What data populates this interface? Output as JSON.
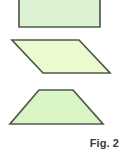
{
  "figure": {
    "caption": "Fig. 2",
    "background_color": "#ffffff",
    "width": 123,
    "height": 152,
    "stroke_color": "#4f584d",
    "stroke_width": 1.6,
    "shapes": [
      {
        "name": "rectangle",
        "label": "rectangle",
        "fill": "#ddf2d3",
        "stroke": "#525b50",
        "points": "19,-8 100,-8 100,27 19,27",
        "note": "top edge cropped by frame"
      },
      {
        "name": "parallelogram",
        "label": "parallelogram",
        "fill": "#ebfbce",
        "stroke": "#4f584d",
        "points": "12,40 79,40 110,73 43,73"
      },
      {
        "name": "trapezoid",
        "label": "trapezoid",
        "fill": "#d9f5c3",
        "stroke": "#4f584d",
        "points": "39,90 73,90 103,124 10,124"
      }
    ]
  }
}
